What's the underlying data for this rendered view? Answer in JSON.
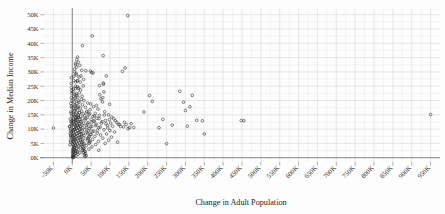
{
  "chart_data": {
    "type": "scatter",
    "title": "",
    "xlabel": "Change in Adult Population",
    "ylabel": "Change in Median Income",
    "xlim": [
      -75000,
      975000
    ],
    "ylim": [
      -1500,
      52000
    ],
    "grid": true,
    "legend": null,
    "xticks": [
      "-50K",
      "0K",
      "50K",
      "100K",
      "150K",
      "200K",
      "250K",
      "300K",
      "350K",
      "400K",
      "450K",
      "500K",
      "550K",
      "600K",
      "650K",
      "700K",
      "750K",
      "800K",
      "850K",
      "900K",
      "950K"
    ],
    "xtick_values": [
      -50000,
      0,
      50000,
      100000,
      150000,
      200000,
      250000,
      300000,
      350000,
      400000,
      450000,
      500000,
      550000,
      600000,
      650000,
      700000,
      750000,
      800000,
      850000,
      900000,
      950000
    ],
    "yticks": [
      "0K",
      "5K",
      "10K",
      "15K",
      "20K",
      "25K",
      "30K",
      "35K",
      "40K",
      "45K",
      "50K"
    ],
    "ytick_values": [
      0,
      5000,
      10000,
      15000,
      20000,
      25000,
      30000,
      35000,
      40000,
      45000,
      50000
    ],
    "marker": "open-circle",
    "marker_color": "#222222",
    "points": [
      [
        -50000,
        10400
      ],
      [
        147000,
        49700
      ],
      [
        53000,
        42600
      ],
      [
        27000,
        39200
      ],
      [
        82000,
        35700
      ],
      [
        14000,
        35200
      ],
      [
        12000,
        34300
      ],
      [
        16000,
        33400
      ],
      [
        9000,
        33000
      ],
      [
        20000,
        32300
      ],
      [
        11000,
        31700
      ],
      [
        140000,
        31400
      ],
      [
        133000,
        30200
      ],
      [
        25000,
        30600
      ],
      [
        36000,
        30400
      ],
      [
        48000,
        30300
      ],
      [
        51000,
        29800
      ],
      [
        55000,
        29600
      ],
      [
        10000,
        29500
      ],
      [
        23000,
        28600
      ],
      [
        18000,
        28200
      ],
      [
        90000,
        28600
      ],
      [
        30000,
        27400
      ],
      [
        14000,
        27000
      ],
      [
        21000,
        26400
      ],
      [
        82000,
        26100
      ],
      [
        83000,
        25700
      ],
      [
        72000,
        25200
      ],
      [
        29000,
        25100
      ],
      [
        13000,
        24900
      ],
      [
        17000,
        24400
      ],
      [
        8000,
        24100
      ],
      [
        22000,
        23700
      ],
      [
        285000,
        23200
      ],
      [
        84000,
        23000
      ],
      [
        19000,
        22700
      ],
      [
        11000,
        22400
      ],
      [
        73000,
        22000
      ],
      [
        318000,
        21800
      ],
      [
        205000,
        21700
      ],
      [
        26000,
        21500
      ],
      [
        15000,
        21200
      ],
      [
        81000,
        21000
      ],
      [
        76000,
        20600
      ],
      [
        24000,
        20400
      ],
      [
        9000,
        20300
      ],
      [
        31000,
        20000
      ],
      [
        212000,
        19700
      ],
      [
        80000,
        19500
      ],
      [
        295000,
        19400
      ],
      [
        18000,
        19300
      ],
      [
        41000,
        19100
      ],
      [
        12000,
        18900
      ],
      [
        99000,
        18700
      ],
      [
        27000,
        18500
      ],
      [
        64000,
        18300
      ],
      [
        7000,
        18100
      ],
      [
        16000,
        17900
      ],
      [
        56000,
        17800
      ],
      [
        312000,
        17800
      ],
      [
        35000,
        17600
      ],
      [
        21000,
        17400
      ],
      [
        10000,
        17200
      ],
      [
        68000,
        17000
      ],
      [
        47000,
        16800
      ],
      [
        14000,
        16700
      ],
      [
        300000,
        16500
      ],
      [
        25000,
        16300
      ],
      [
        5000,
        16200
      ],
      [
        86000,
        16100
      ],
      [
        190000,
        16000
      ],
      [
        38000,
        15900
      ],
      [
        19000,
        15700
      ],
      [
        11000,
        15600
      ],
      [
        61000,
        15500
      ],
      [
        950000,
        15100
      ],
      [
        29000,
        15300
      ],
      [
        8000,
        15200
      ],
      [
        44000,
        15100
      ],
      [
        96000,
        15000
      ],
      [
        16000,
        14900
      ],
      [
        72000,
        14800
      ],
      [
        33000,
        14700
      ],
      [
        6000,
        14600
      ],
      [
        22000,
        14500
      ],
      [
        55000,
        14400
      ],
      [
        13000,
        14300
      ],
      [
        105000,
        14200
      ],
      [
        40000,
        14100
      ],
      [
        17000,
        14000
      ],
      [
        9000,
        13900
      ],
      [
        65000,
        13800
      ],
      [
        27000,
        13700
      ],
      [
        110000,
        13600
      ],
      [
        4000,
        13500
      ],
      [
        50000,
        13400
      ],
      [
        20000,
        13300
      ],
      [
        240000,
        13400
      ],
      [
        34000,
        13200
      ],
      [
        12000,
        13100
      ],
      [
        88000,
        13000
      ],
      [
        448000,
        13000
      ],
      [
        455000,
        12900
      ],
      [
        330000,
        13100
      ],
      [
        345000,
        12900
      ],
      [
        7000,
        12800
      ],
      [
        58000,
        12700
      ],
      [
        24000,
        12600
      ],
      [
        15000,
        12500
      ],
      [
        118000,
        12400
      ],
      [
        42000,
        12300
      ],
      [
        10000,
        12200
      ],
      [
        77000,
        12100
      ],
      [
        30000,
        12000
      ],
      [
        18000,
        11900
      ],
      [
        5000,
        11800
      ],
      [
        63000,
        11700
      ],
      [
        125000,
        11600
      ],
      [
        26000,
        11500
      ],
      [
        13000,
        11400
      ],
      [
        93000,
        11300
      ],
      [
        265000,
        11400
      ],
      [
        305000,
        11000
      ],
      [
        37000,
        11200
      ],
      [
        8000,
        11100
      ],
      [
        21000,
        11000
      ],
      [
        52000,
        10900
      ],
      [
        136000,
        10800
      ],
      [
        16000,
        10700
      ],
      [
        3000,
        10600
      ],
      [
        70000,
        10500
      ],
      [
        28000,
        10400
      ],
      [
        11000,
        10300
      ],
      [
        148000,
        10200
      ],
      [
        45000,
        10100
      ],
      [
        19000,
        10000
      ],
      [
        6000,
        9900
      ],
      [
        84000,
        9800
      ],
      [
        230000,
        10500
      ],
      [
        33000,
        9700
      ],
      [
        14000,
        9600
      ],
      [
        100000,
        9500
      ],
      [
        2000,
        9400
      ],
      [
        57000,
        9300
      ],
      [
        23000,
        9200
      ],
      [
        9000,
        9100
      ],
      [
        112000,
        9000
      ],
      [
        39000,
        8900
      ],
      [
        17000,
        8800
      ],
      [
        4000,
        8700
      ],
      [
        66000,
        8600
      ],
      [
        350000,
        8300
      ],
      [
        29000,
        8500
      ],
      [
        12000,
        8400
      ],
      [
        91000,
        8300
      ],
      [
        48000,
        8200
      ],
      [
        20000,
        8100
      ],
      [
        7000,
        8000
      ],
      [
        75000,
        7900
      ],
      [
        31000,
        7800
      ],
      [
        15000,
        7700
      ],
      [
        1000,
        7600
      ],
      [
        60000,
        7500
      ],
      [
        25000,
        7400
      ],
      [
        10000,
        7300
      ],
      [
        104000,
        7200
      ],
      [
        43000,
        7100
      ],
      [
        18000,
        7000
      ],
      [
        5000,
        6900
      ],
      [
        81000,
        6800
      ],
      [
        35000,
        6700
      ],
      [
        13000,
        6600
      ],
      [
        3000,
        6500
      ],
      [
        54000,
        6400
      ],
      [
        22000,
        6300
      ],
      [
        8000,
        6200
      ],
      [
        96000,
        6100
      ],
      [
        41000,
        6000
      ],
      [
        16000,
        5900
      ],
      [
        2000,
        5800
      ],
      [
        69000,
        5700
      ],
      [
        27000,
        5600
      ],
      [
        11000,
        5500
      ],
      [
        120000,
        5400
      ],
      [
        46000,
        5300
      ],
      [
        19000,
        5200
      ],
      [
        6000,
        5100
      ],
      [
        87000,
        5000
      ],
      [
        250000,
        4900
      ],
      [
        32000,
        4900
      ],
      [
        14000,
        4800
      ],
      [
        1000,
        4700
      ],
      [
        62000,
        4600
      ],
      [
        24000,
        4500
      ],
      [
        9000,
        4400
      ],
      [
        37000,
        4200
      ],
      [
        17000,
        4100
      ],
      [
        4000,
        4000
      ],
      [
        52000,
        3800
      ],
      [
        21000,
        3700
      ],
      [
        7000,
        3600
      ],
      [
        30000,
        3400
      ],
      [
        12000,
        3300
      ],
      [
        2000,
        3200
      ],
      [
        44000,
        3000
      ],
      [
        16000,
        2900
      ],
      [
        5000,
        2800
      ],
      [
        70000,
        2600
      ],
      [
        26000,
        2500
      ],
      [
        10000,
        2400
      ],
      [
        1500,
        2300
      ],
      [
        34000,
        2100
      ],
      [
        13000,
        2000
      ],
      [
        3500,
        1900
      ],
      [
        20000,
        1700
      ],
      [
        8000,
        1600
      ],
      [
        500,
        1500
      ],
      [
        15000,
        1200
      ],
      [
        5500,
        1100
      ],
      [
        2500,
        900
      ],
      [
        9500,
        700
      ],
      [
        1200,
        500
      ],
      [
        4000,
        300
      ],
      [
        700,
        150
      ],
      [
        2800,
        60
      ],
      [
        -2000,
        9000
      ],
      [
        -3000,
        11500
      ],
      [
        -1500,
        13000
      ],
      [
        -4000,
        7500
      ],
      [
        -2500,
        15500
      ],
      [
        -5000,
        6000
      ],
      [
        -1000,
        17500
      ],
      [
        -3500,
        19000
      ],
      [
        -6000,
        4500
      ],
      [
        -2200,
        21000
      ],
      [
        -4500,
        10000
      ],
      [
        -1800,
        23500
      ],
      [
        -3200,
        12500
      ],
      [
        -5500,
        8500
      ],
      [
        -2800,
        26000
      ],
      [
        -1200,
        14500
      ],
      [
        -4200,
        5500
      ],
      [
        -2600,
        18000
      ],
      [
        -3800,
        16000
      ],
      [
        -900,
        20000
      ],
      [
        -6500,
        11000
      ],
      [
        -2100,
        28000
      ],
      [
        -4800,
        9500
      ],
      [
        -1600,
        22500
      ],
      [
        -3400,
        7000
      ],
      [
        -5200,
        13500
      ],
      [
        -2400,
        24500
      ],
      [
        -1100,
        12000
      ],
      [
        -3900,
        8000
      ],
      [
        -7000,
        10800
      ],
      [
        6500,
        31000
      ],
      [
        4500,
        28500
      ],
      [
        8500,
        26500
      ],
      [
        3000,
        24000
      ],
      [
        7500,
        22000
      ],
      [
        5000,
        19500
      ],
      [
        9000,
        32500
      ],
      [
        6000,
        30000
      ],
      [
        3500,
        27000
      ],
      [
        8000,
        25000
      ],
      [
        4000,
        21500
      ],
      [
        7000,
        18500
      ],
      [
        5500,
        16500
      ],
      [
        9500,
        14000
      ],
      [
        2000,
        23000
      ],
      [
        6800,
        20800
      ],
      [
        4200,
        17200
      ],
      [
        8800,
        13200
      ],
      [
        3200,
        15000
      ],
      [
        7200,
        11500
      ],
      [
        5800,
        9800
      ],
      [
        2600,
        12800
      ],
      [
        9200,
        10200
      ],
      [
        4800,
        7800
      ],
      [
        6200,
        6400
      ],
      [
        3800,
        5400
      ],
      [
        8200,
        4400
      ],
      [
        5200,
        3600
      ],
      [
        2400,
        2700
      ],
      [
        7800,
        2200
      ],
      [
        11000,
        29000
      ],
      [
        13000,
        26800
      ],
      [
        15500,
        24200
      ],
      [
        12000,
        21800
      ],
      [
        17000,
        19800
      ],
      [
        14000,
        17600
      ],
      [
        19000,
        15800
      ],
      [
        16000,
        14200
      ],
      [
        21000,
        12700
      ],
      [
        18000,
        11300
      ],
      [
        23000,
        10100
      ],
      [
        20000,
        9000
      ],
      [
        25000,
        8000
      ],
      [
        22000,
        7000
      ],
      [
        27000,
        6200
      ],
      [
        24000,
        5400
      ],
      [
        29000,
        4700
      ],
      [
        26000,
        4000
      ],
      [
        31000,
        3300
      ],
      [
        28000,
        2800
      ],
      [
        33000,
        2300
      ],
      [
        30000,
        1800
      ],
      [
        35000,
        1400
      ],
      [
        32000,
        1000
      ],
      [
        37000,
        700
      ],
      [
        34000,
        400
      ],
      [
        39000,
        16200
      ],
      [
        36000,
        13800
      ],
      [
        41000,
        11800
      ],
      [
        38000,
        10600
      ],
      [
        43000,
        9400
      ],
      [
        40000,
        8400
      ],
      [
        45000,
        7400
      ],
      [
        42000,
        6600
      ],
      [
        47000,
        5800
      ],
      [
        44000,
        5000
      ],
      [
        49000,
        18800
      ],
      [
        46000,
        15400
      ],
      [
        51000,
        12200
      ],
      [
        48000,
        10800
      ],
      [
        53000,
        9200
      ],
      [
        50000,
        8100
      ],
      [
        59000,
        14600
      ],
      [
        57000,
        12900
      ],
      [
        62000,
        11200
      ],
      [
        67000,
        9600
      ],
      [
        71000,
        13700
      ],
      [
        74000,
        10700
      ],
      [
        79000,
        12600
      ],
      [
        85000,
        14900
      ],
      [
        89000,
        11900
      ],
      [
        94000,
        10400
      ],
      [
        98000,
        13300
      ],
      [
        102000,
        12100
      ],
      [
        107000,
        11000
      ],
      [
        114000,
        12900
      ],
      [
        122000,
        11700
      ],
      [
        128000,
        10900
      ],
      [
        138000,
        12400
      ],
      [
        143000,
        11600
      ],
      [
        152000,
        10500
      ],
      [
        156000,
        11900
      ],
      [
        163000,
        10600
      ]
    ]
  }
}
